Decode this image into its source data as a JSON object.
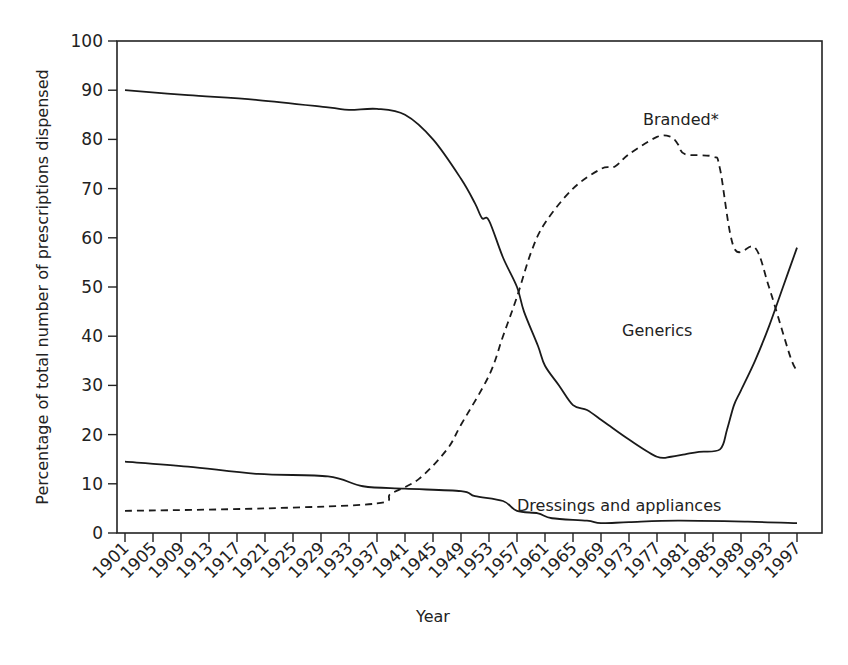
{
  "chart_data": {
    "type": "line",
    "title": "",
    "xlabel": "Year",
    "ylabel": "Percentage of total number of prescriptions dispensed",
    "ylim": [
      0,
      100
    ],
    "xlim": [
      1901,
      1997
    ],
    "grid": false,
    "legend": "inline labels",
    "y_ticks": [
      0,
      10,
      20,
      30,
      40,
      50,
      60,
      70,
      80,
      90,
      100
    ],
    "x_ticks": [
      "1901",
      "1905",
      "1909",
      "1913",
      "1917",
      "1921",
      "1925",
      "1929",
      "1933",
      "1937",
      "1941",
      "1945",
      "1949",
      "1953",
      "1957",
      "1961",
      "1965",
      "1969",
      "1973",
      "1977",
      "1981",
      "1985",
      "1989",
      "1993",
      "1997"
    ],
    "series": [
      {
        "name": "Generics",
        "style": "solid",
        "label_pos": [
          1972,
          40
        ],
        "x": [
          1901,
          1910,
          1920,
          1930,
          1933,
          1937,
          1941,
          1945,
          1949,
          1951,
          1952,
          1953,
          1955,
          1957,
          1958,
          1960,
          1961,
          1963,
          1965,
          1967,
          1969,
          1970,
          1973,
          1977,
          1979,
          1981,
          1983,
          1986,
          1987,
          1988,
          1989,
          1991,
          1993,
          1995,
          1997
        ],
        "values": [
          90,
          89,
          88,
          86.5,
          86,
          86.2,
          85,
          80,
          72,
          67,
          64,
          63.5,
          56,
          50,
          45,
          38,
          34,
          30,
          26,
          25,
          23,
          22,
          19,
          15.5,
          15.5,
          16,
          16.5,
          17,
          21,
          26,
          29,
          35,
          42,
          50,
          58
        ]
      },
      {
        "name": "Branded*",
        "style": "dashed",
        "label_pos": [
          1975,
          83
        ],
        "x": [
          1901,
          1921,
          1937,
          1939,
          1943,
          1947,
          1949,
          1953,
          1955,
          1957,
          1959,
          1961,
          1965,
          1969,
          1971,
          1973,
          1977,
          1979,
          1980,
          1981,
          1985,
          1986,
          1988,
          1991,
          1993,
          1996,
          1997
        ],
        "values": [
          4.5,
          5,
          6,
          8,
          11,
          17,
          22,
          32,
          40,
          48,
          57,
          63,
          70,
          74,
          74.5,
          77,
          80.5,
          80.5,
          79,
          77,
          76.5,
          74,
          58,
          58,
          50,
          36,
          33
        ]
      },
      {
        "name": "Dressings and appliances",
        "style": "solid",
        "label_pos": [
          1957,
          4.5
        ],
        "x": [
          1901,
          1910,
          1920,
          1930,
          1935,
          1941,
          1949,
          1951,
          1955,
          1957,
          1960,
          1962,
          1967,
          1969,
          1973,
          1980,
          1990,
          1997
        ],
        "values": [
          14.5,
          13.5,
          12,
          11.5,
          9.5,
          9,
          8.5,
          7.5,
          6.5,
          4.5,
          4,
          3,
          2.5,
          2,
          2.2,
          2.5,
          2.3,
          2
        ]
      }
    ]
  },
  "colors": {
    "line": "#1a1a1a",
    "axis": "#222222",
    "background": "#ffffff"
  }
}
